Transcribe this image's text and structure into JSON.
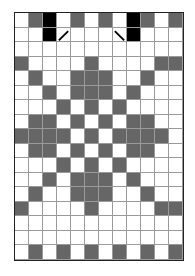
{
  "caption": "",
  "colors": {
    "white": "#ffffff",
    "gray": "#666666",
    "black": "#000000",
    "gridline": "#9a9a9a"
  },
  "grid": {
    "columns": 12,
    "rows": 17,
    "cells": [
      "WGBWGWGWBGWG",
      "WWBWWWWWBWWW",
      "WWWWWWWWWWWW",
      "GWWWWGWWWWGG",
      "WGWWGGGWWGWW",
      "WWGWGGGWGWWW",
      "WWWGWGWGWWWW",
      "WGGWGWGWGGWW",
      "GGGGWGWGGGGW",
      "WGGWGWGWGGWW",
      "WWWGWGWGWWWW",
      "WWGWGGGWGWWW",
      "WGWWGGGWWGWW",
      "GWWWWGWWWWGG",
      "WWWWWWWWWWWW",
      "WWWWWWWWWWWW",
      "WGWGWGWGWGWG"
    ],
    "markers": [
      {
        "row": 1,
        "col": 3,
        "type": "diagonal-up",
        "icon": "slash-mark"
      },
      {
        "row": 1,
        "col": 7,
        "type": "diagonal-down",
        "icon": "backslash-mark"
      }
    ]
  }
}
